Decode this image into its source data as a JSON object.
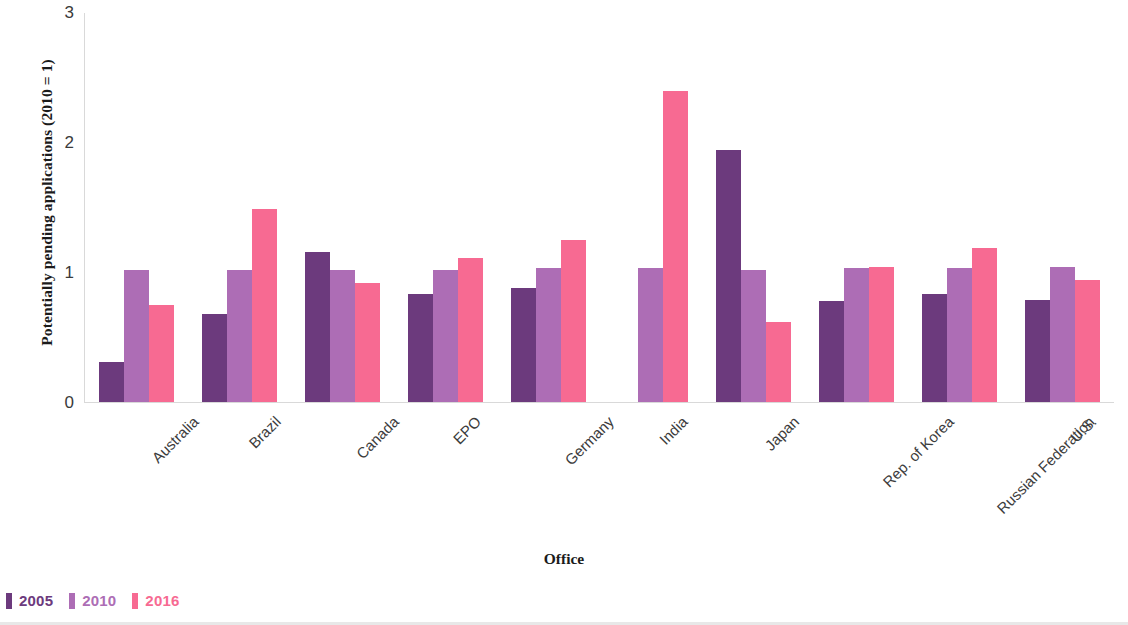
{
  "chart_data": {
    "type": "bar",
    "title": "",
    "xlabel": "Office",
    "ylabel": "Potentially pending applications (2010 = 1)",
    "ylim": [
      0,
      3
    ],
    "yticks": [
      "0",
      "1",
      "2",
      "3"
    ],
    "grid": false,
    "legend_position": "bottom-left",
    "categories": [
      "Australia",
      "Brazil",
      "Canada",
      "EPO",
      "Germany",
      "India",
      "Japan",
      "Rep. of Korea",
      "Russian Federation",
      "U.S."
    ],
    "series": [
      {
        "name": "2005",
        "color": "#6c3a7d",
        "values": [
          0.31,
          0.68,
          1.16,
          0.83,
          0.88,
          null,
          1.94,
          0.78,
          0.83,
          0.79
        ]
      },
      {
        "name": "2010",
        "color": "#ad6db5",
        "values": [
          1.02,
          1.02,
          1.02,
          1.02,
          1.03,
          1.03,
          1.02,
          1.03,
          1.03,
          1.04
        ]
      },
      {
        "name": "2016",
        "color": "#f76a92",
        "values": [
          0.75,
          1.49,
          0.92,
          1.11,
          1.25,
          2.4,
          0.62,
          1.04,
          1.19,
          0.94
        ]
      }
    ]
  },
  "legend": {
    "items": [
      {
        "label": "2005",
        "color": "#6c3a7d"
      },
      {
        "label": "2010",
        "color": "#ad6db5"
      },
      {
        "label": "2016",
        "color": "#f76a92"
      }
    ]
  }
}
